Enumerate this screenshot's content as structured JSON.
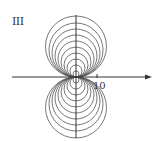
{
  "panel_label": "III",
  "tick_label": "10",
  "colors": {
    "stroke": "#555555",
    "axis": "#333333",
    "background": "#ffffff"
  },
  "diagram": {
    "type": "family of circles tangent to x-axis at origin",
    "origin_px": [
      76,
      77
    ],
    "radii_px": [
      3,
      6,
      9,
      12,
      15,
      18,
      21,
      24,
      27,
      30.5
    ],
    "x_axis": {
      "from": 12,
      "to": 152,
      "arrow": true
    },
    "y_axis": {
      "from": 15,
      "to": 138
    },
    "tick_x_px": 97
  }
}
